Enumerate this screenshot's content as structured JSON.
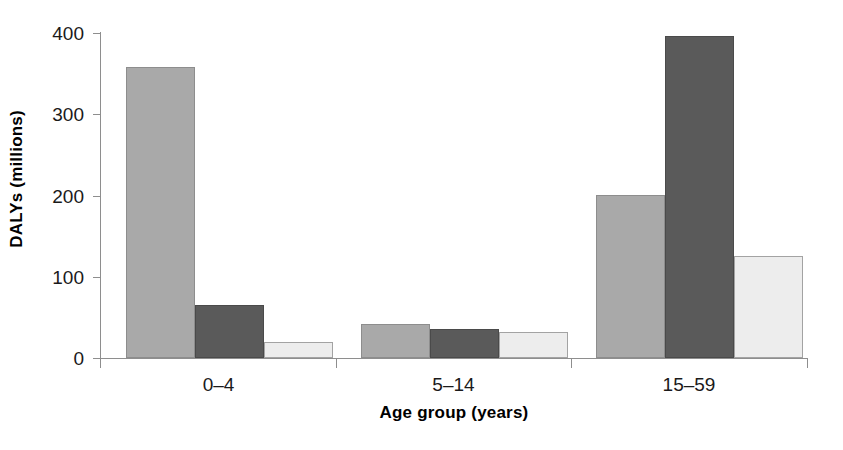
{
  "chart_data": {
    "type": "bar",
    "title": "",
    "subtitle": "",
    "xlabel": "Age group (years)",
    "ylabel": "DALYs (millions)",
    "categories": [
      "0–4",
      "5–14",
      "15–59"
    ],
    "series": [
      {
        "name": "series-1",
        "color": "#a9a9a9",
        "values": [
          358,
          42,
          201
        ]
      },
      {
        "name": "series-2",
        "color": "#5a5a5a",
        "values": [
          65,
          36,
          396
        ]
      },
      {
        "name": "series-3",
        "color": "#ededed",
        "values": [
          20,
          32,
          126
        ]
      }
    ],
    "ylim": [
      0,
      400
    ],
    "yticks": [
      0,
      100,
      200,
      300,
      400
    ],
    "ytick_labels": [
      "0",
      "100",
      "200",
      "300",
      "400"
    ],
    "grid": false,
    "legend": "none",
    "bar_layout": "grouped-adjacent",
    "axis_color": "#8e8e8e",
    "text_color": "#1a1a1a"
  },
  "axes": {
    "y_title": "DALYs (millions)",
    "x_title": "Age group (years)",
    "y_labels": [
      "400",
      "300",
      "200",
      "100",
      "0"
    ],
    "x_labels": [
      "0–4",
      "5–14",
      "15–59"
    ]
  }
}
